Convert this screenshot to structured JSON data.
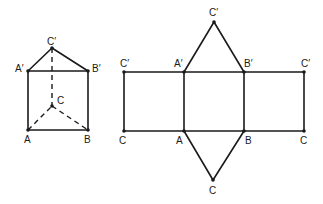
{
  "prism": {
    "labels": {
      "C_top": "C′",
      "A_top": "A′",
      "B_top": "B′",
      "C_bottom": "C",
      "A_bottom": "A",
      "B_bottom": "B"
    }
  },
  "net": {
    "labels": {
      "apex_top": "C′",
      "left_top": "C′",
      "A_top": "A′",
      "B_top": "B′",
      "right_top": "C′",
      "left_bottom": "C",
      "A_bottom": "A",
      "B_bottom": "B",
      "right_bottom": "C",
      "apex_bottom": "C"
    }
  },
  "colors": {
    "line": "#1a1a1a",
    "background": "#ffffff"
  }
}
